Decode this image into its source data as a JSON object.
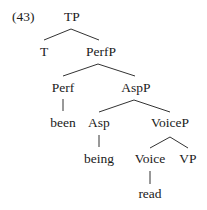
{
  "example_number": "(43)",
  "tree": {
    "nodes": [
      {
        "id": "TP",
        "label": "TP",
        "x": 72,
        "y": 21
      },
      {
        "id": "T",
        "label": "T",
        "x": 44,
        "y": 56
      },
      {
        "id": "PerfP",
        "label": "PerfP",
        "x": 101,
        "y": 56
      },
      {
        "id": "Perf",
        "label": "Perf",
        "x": 63,
        "y": 92
      },
      {
        "id": "AspP",
        "label": "AspP",
        "x": 136,
        "y": 92
      },
      {
        "id": "been",
        "label": "been",
        "x": 63,
        "y": 127
      },
      {
        "id": "Asp",
        "label": "Asp",
        "x": 99,
        "y": 127
      },
      {
        "id": "VoiceP",
        "label": "VoiceP",
        "x": 170,
        "y": 127
      },
      {
        "id": "being",
        "label": "being",
        "x": 99,
        "y": 163
      },
      {
        "id": "Voice",
        "label": "Voice",
        "x": 150,
        "y": 163
      },
      {
        "id": "VP",
        "label": "VP",
        "x": 188,
        "y": 163
      },
      {
        "id": "read",
        "label": "read",
        "x": 150,
        "y": 198
      }
    ],
    "edges": [
      {
        "from": "TP",
        "to": "T",
        "x1": 71,
        "y1": 29,
        "x2": 44,
        "y2": 40
      },
      {
        "from": "TP",
        "to": "PerfP",
        "x1": 71,
        "y1": 29,
        "x2": 99,
        "y2": 40
      },
      {
        "from": "PerfP",
        "to": "Perf",
        "x1": 98,
        "y1": 64,
        "x2": 63,
        "y2": 76
      },
      {
        "from": "PerfP",
        "to": "AspP",
        "x1": 98,
        "y1": 64,
        "x2": 135,
        "y2": 76
      },
      {
        "from": "Perf",
        "to": "been",
        "x1": 63,
        "y1": 99,
        "x2": 63,
        "y2": 111
      },
      {
        "from": "AspP",
        "to": "Asp",
        "x1": 134,
        "y1": 100,
        "x2": 99,
        "y2": 112
      },
      {
        "from": "AspP",
        "to": "VoiceP",
        "x1": 134,
        "y1": 100,
        "x2": 170,
        "y2": 112
      },
      {
        "from": "Asp",
        "to": "being",
        "x1": 99,
        "y1": 135,
        "x2": 99,
        "y2": 147
      },
      {
        "from": "VoiceP",
        "to": "Voice",
        "x1": 170,
        "y1": 137,
        "x2": 150,
        "y2": 148
      },
      {
        "from": "VoiceP",
        "to": "VP",
        "x1": 170,
        "y1": 137,
        "x2": 188,
        "y2": 148
      },
      {
        "from": "Voice",
        "to": "read",
        "x1": 150,
        "y1": 171,
        "x2": 150,
        "y2": 184
      }
    ]
  }
}
